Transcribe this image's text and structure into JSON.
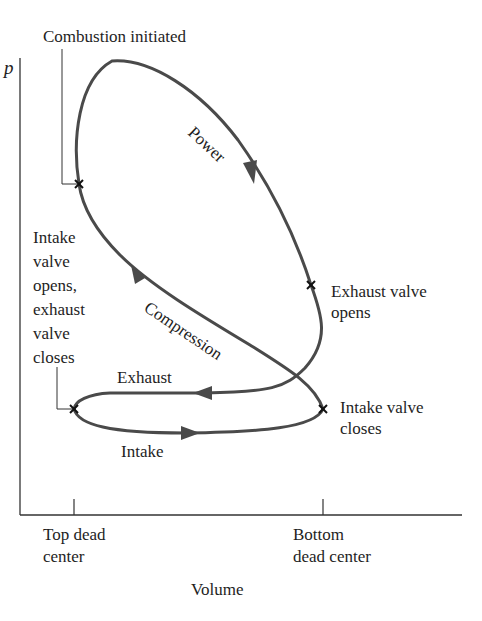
{
  "diagram": {
    "title": "",
    "type": "p-V indicator diagram (four-stroke engine cycle)",
    "axes": {
      "y_label": "p",
      "x_label": "Volume",
      "x_ticks": [
        {
          "label": "Top dead\ncenter",
          "x": 74
        },
        {
          "label": "Bottom\ndead center",
          "x": 323
        }
      ]
    },
    "events": [
      {
        "id": "combustion",
        "label": "Combustion initiated",
        "x": 79,
        "y": 184
      },
      {
        "id": "exhaust-opens",
        "label": "Exhaust valve\nopens",
        "x": 311,
        "y": 285
      },
      {
        "id": "intake-closes",
        "label": "Intake valve\ncloses",
        "x": 323,
        "y": 409
      },
      {
        "id": "intake-opens",
        "label": "Intake\nvalve\nopens,\nexhaust\nvalve\ncloses",
        "x": 74,
        "y": 409
      }
    ],
    "strokes": [
      {
        "id": "power",
        "label": "Power"
      },
      {
        "id": "compression",
        "label": "Compression"
      },
      {
        "id": "exhaust",
        "label": "Exhaust"
      },
      {
        "id": "intake",
        "label": "Intake"
      }
    ],
    "colors": {
      "curve": "#4a4a4a",
      "axis": "#333333",
      "text": "#1e1e1e"
    }
  }
}
